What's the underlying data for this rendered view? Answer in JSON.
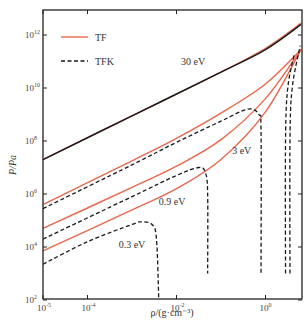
{
  "chart_data": {
    "type": "line",
    "title": "",
    "xlabel": "ρ/(g·cm⁻³)",
    "ylabel": "P/Pa",
    "xscale": "log",
    "yscale": "log",
    "xlim_log10": [
      -5,
      0.8
    ],
    "ylim_log10": [
      2,
      12.9
    ],
    "x_ticks": [
      {
        "log": -5,
        "label": "10",
        "exp": "-5"
      },
      {
        "log": -4,
        "label": "10",
        "exp": "-4"
      },
      {
        "log": -2,
        "label": "10",
        "exp": "-2"
      },
      {
        "log": 0,
        "label": "10",
        "exp": "0"
      }
    ],
    "y_ticks": [
      {
        "log": 12,
        "label": "10",
        "exp": "12"
      },
      {
        "log": 10,
        "label": "10",
        "exp": "10"
      },
      {
        "log": 8,
        "label": "10",
        "exp": "8"
      },
      {
        "log": 6,
        "label": "10",
        "exp": "6"
      },
      {
        "log": 4,
        "label": "10",
        "exp": "4"
      },
      {
        "log": 2,
        "label": "10",
        "exp": "2"
      }
    ],
    "grid": false,
    "legend": {
      "position": "upper-left",
      "entries": [
        {
          "name": "TF",
          "style": "solid",
          "color": "#e8674a"
        },
        {
          "name": "TFK",
          "style": "dashed",
          "color": "#1a1a1a"
        }
      ]
    },
    "series": [
      {
        "name": "TF 30 eV",
        "model": "TF",
        "temperature": "30 eV",
        "color": "#e8674a",
        "points_log10": [
          [
            -5,
            7.3
          ],
          [
            -3,
            8.95
          ],
          [
            -1,
            10.6
          ],
          [
            0,
            11.5
          ],
          [
            0.8,
            12.45
          ]
        ]
      },
      {
        "name": "TFK 30 eV",
        "model": "TFK",
        "temperature": "30 eV",
        "color": "#1a1a1a",
        "points_log10": [
          [
            -5,
            7.3
          ],
          [
            -3,
            8.95
          ],
          [
            -1,
            10.6
          ],
          [
            0,
            11.45
          ],
          [
            0.8,
            12.4
          ]
        ]
      },
      {
        "name": "TF 3 eV",
        "model": "TF",
        "temperature": "3 eV",
        "color": "#e8674a",
        "points_log10": [
          [
            -5,
            5.6
          ],
          [
            -3,
            7.25
          ],
          [
            -2,
            8.1
          ],
          [
            -1,
            9.05
          ],
          [
            0,
            10.15
          ],
          [
            0.8,
            11.45
          ]
        ]
      },
      {
        "name": "TFK 3 eV",
        "model": "TFK",
        "temperature": "3 eV",
        "color": "#1a1a1a",
        "points_log10": [
          [
            -5,
            5.45
          ],
          [
            -3,
            7.1
          ],
          [
            -2,
            7.95
          ],
          [
            -1,
            8.75
          ],
          [
            -0.4,
            9.2
          ],
          [
            -0.15,
            9.0
          ],
          [
            -0.1,
            8.3
          ],
          [
            -0.1,
            3.0
          ]
        ]
      },
      {
        "name": "TF 0.9 eV",
        "model": "TF",
        "temperature": "0.9 eV",
        "color": "#e8674a",
        "points_log10": [
          [
            -5,
            4.7
          ],
          [
            -3,
            6.25
          ],
          [
            -2,
            7.05
          ],
          [
            -1,
            8.05
          ],
          [
            0,
            9.6
          ],
          [
            0.8,
            11.45
          ]
        ]
      },
      {
        "name": "TFK 0.9 eV",
        "model": "TFK",
        "temperature": "0.9 eV",
        "color": "#1a1a1a",
        "points_log10": [
          [
            -5,
            4.3
          ],
          [
            -3,
            5.9
          ],
          [
            -2,
            6.7
          ],
          [
            -1.5,
            7.0
          ],
          [
            -1.35,
            6.8
          ],
          [
            -1.3,
            6.0
          ],
          [
            -1.3,
            3.0
          ]
        ]
      },
      {
        "name": "TF 0.3 eV",
        "model": "TF",
        "temperature": "0.3 eV",
        "color": "#e8674a",
        "points_log10": [
          [
            -5,
            3.85
          ],
          [
            -3,
            5.4
          ],
          [
            -2,
            6.2
          ],
          [
            -1,
            7.3
          ],
          [
            0,
            9.1
          ],
          [
            0.8,
            11.45
          ]
        ]
      },
      {
        "name": "TFK 0.3 eV",
        "model": "TFK",
        "temperature": "0.3 eV",
        "color": "#1a1a1a",
        "points_log10": [
          [
            -5,
            3.35
          ],
          [
            -4,
            4.2
          ],
          [
            -3,
            4.85
          ],
          [
            -2.8,
            4.95
          ],
          [
            -2.55,
            4.85
          ],
          [
            -2.45,
            4.3
          ],
          [
            -2.4,
            2.1
          ]
        ]
      },
      {
        "name": "TFK high-density branch A",
        "model": "TFK",
        "temperature": "",
        "color": "#1a1a1a",
        "points_log10": [
          [
            0.45,
            3.0
          ],
          [
            0.45,
            8.0
          ],
          [
            0.5,
            10.0
          ],
          [
            0.65,
            11.3
          ]
        ]
      },
      {
        "name": "TFK high-density branch B",
        "model": "TFK",
        "temperature": "",
        "color": "#1a1a1a",
        "points_log10": [
          [
            0.55,
            3.0
          ],
          [
            0.55,
            8.0
          ],
          [
            0.6,
            10.0
          ],
          [
            0.78,
            11.6
          ]
        ]
      }
    ],
    "annotations": [
      {
        "text": "30 eV",
        "log_x": -1.9,
        "log_y": 10.85
      },
      {
        "text": "3 eV",
        "log_x": -0.75,
        "log_y": 7.5
      },
      {
        "text": "0.9 eV",
        "log_x": -2.4,
        "log_y": 5.6
      },
      {
        "text": "0.3 eV",
        "log_x": -3.3,
        "log_y": 3.95
      }
    ]
  },
  "axes": {
    "xlabel": "ρ/(g·cm⁻³)",
    "ylabel": "P/Pa"
  },
  "legend": {
    "tf_label": "TF",
    "tfk_label": "TFK"
  }
}
